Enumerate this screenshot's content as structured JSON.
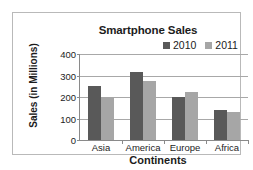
{
  "chart_data": {
    "type": "bar",
    "title": "Smartphone Sales",
    "xlabel": "Continents",
    "ylabel": "Sales (in Millions)",
    "categories": [
      "Asia",
      "America",
      "Europe",
      "Africa"
    ],
    "series": [
      {
        "name": "2010",
        "color": "#595959",
        "values": [
          250,
          315,
          202,
          140
        ]
      },
      {
        "name": "2011",
        "color": "#a6a6a6",
        "values": [
          200,
          275,
          222,
          130
        ]
      }
    ],
    "ylim": [
      0,
      400
    ],
    "yticks": [
      0,
      100,
      200,
      300,
      400
    ],
    "ytick_labels": [
      "0",
      "100",
      "200",
      "300",
      "400"
    ],
    "grid": true,
    "legend_position": "top-right",
    "axis_color": "#8a8a8a",
    "grid_color": "#a8a8a8",
    "text_color": "#1c1c1c"
  }
}
